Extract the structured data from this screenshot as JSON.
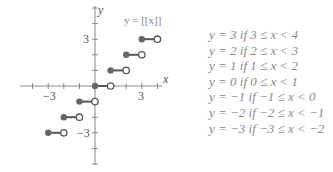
{
  "graph": {
    "title": "y = [[x]]",
    "axis_x_label": "x",
    "axis_y_label": "y",
    "tick_labels": {
      "x_neg": "−3",
      "x_pos": "3",
      "y_pos": "3",
      "y_neg": "−3"
    },
    "colors": {
      "axis": "#777777",
      "filled_dot": "#666666",
      "segment": "#555555",
      "open_dot_stroke": "#555555"
    }
  },
  "chart_data": {
    "type": "line",
    "title": "y = [[x]]",
    "xlabel": "x",
    "ylabel": "y",
    "xlim": [
      -4.5,
      4.5
    ],
    "ylim": [
      -5,
      5
    ],
    "grid": false,
    "segments": [
      {
        "x_start": -3,
        "x_end": -2,
        "y": -3,
        "start_closed": true,
        "end_closed": false
      },
      {
        "x_start": -2,
        "x_end": -1,
        "y": -2,
        "start_closed": true,
        "end_closed": false
      },
      {
        "x_start": -1,
        "x_end": 0,
        "y": -1,
        "start_closed": true,
        "end_closed": false
      },
      {
        "x_start": 0,
        "x_end": 1,
        "y": 0,
        "start_closed": true,
        "end_closed": false
      },
      {
        "x_start": 1,
        "x_end": 2,
        "y": 1,
        "start_closed": true,
        "end_closed": false
      },
      {
        "x_start": 2,
        "x_end": 3,
        "y": 2,
        "start_closed": true,
        "end_closed": false
      },
      {
        "x_start": 3,
        "x_end": 4,
        "y": 3,
        "start_closed": true,
        "end_closed": false
      }
    ]
  },
  "cases": [
    "y = 3 if 3 ≤ x < 4",
    "y = 2 if 2 ≤ x < 3",
    "y = 1 if 1 ≤ x < 2",
    "y = 0 if 0 ≤ x < 1",
    "y = −1 if −1 ≤ x < 0",
    "y = −2 if −2 ≤ x < −1",
    "y = −3 if −3 ≤ x < −2"
  ]
}
